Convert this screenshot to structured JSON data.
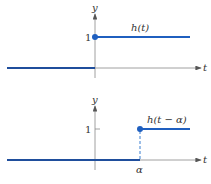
{
  "top_panel": {
    "y_axis_label": "y",
    "x_axis_label": "t",
    "tick_label_1": "1",
    "function_label": "h(t)"
  },
  "bottom_panel": {
    "y_axis_label": "y",
    "x_axis_label": "t",
    "tick_label_1": "1",
    "function_label": "h(t − α)",
    "shift_label": "α"
  },
  "colors": {
    "curve": "#1f4e9c",
    "axis": "#777777",
    "dot": "#1f5fbf"
  }
}
